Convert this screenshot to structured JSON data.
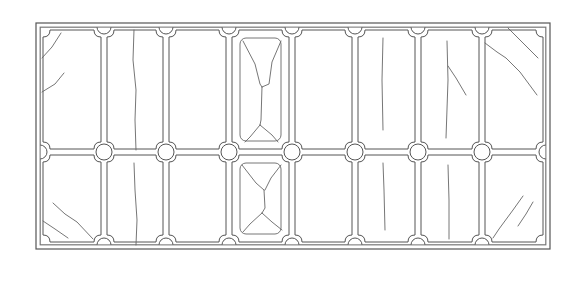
{
  "diagram": {
    "colors": {
      "line": "#555555",
      "background": "#ffffff"
    },
    "frame": {
      "outer": {
        "x": 36,
        "y": 23,
        "w": 514,
        "h": 226
      },
      "inner": {
        "x": 40,
        "y": 27,
        "w": 506,
        "h": 218
      }
    },
    "grid": {
      "rows": 2,
      "cols": 8,
      "col_edges": [
        40,
        104,
        166,
        229,
        292,
        355,
        418,
        482,
        546
      ],
      "row_edges": [
        27,
        152,
        245
      ],
      "joint_radius": 8,
      "notch": 7,
      "gap": 3
    },
    "insets": [
      {
        "row": 0,
        "col": 3
      },
      {
        "row": 1,
        "col": 3
      }
    ],
    "cracks": [
      {
        "pane": "r0c0",
        "points": [
          [
            42,
            58
          ],
          [
            52,
            47
          ],
          [
            61,
            33
          ]
        ]
      },
      {
        "pane": "r0c0",
        "points": [
          [
            42,
            92
          ],
          [
            55,
            84
          ],
          [
            64,
            73
          ]
        ]
      },
      {
        "pane": "r0c1",
        "points": [
          [
            134,
            30
          ],
          [
            133,
            60
          ],
          [
            136,
            90
          ],
          [
            135,
            120
          ],
          [
            136,
            150
          ]
        ]
      },
      {
        "pane": "r0c3",
        "points": [
          [
            243,
            41
          ],
          [
            255,
            64
          ],
          [
            260,
            84
          ],
          [
            262,
            87
          ]
        ]
      },
      {
        "pane": "r0c3",
        "points": [
          [
            281,
            41
          ],
          [
            272,
            62
          ],
          [
            269,
            84
          ],
          [
            262,
            87
          ]
        ]
      },
      {
        "pane": "r0c3",
        "points": [
          [
            262,
            87
          ],
          [
            261,
            120
          ],
          [
            260,
            125
          ]
        ]
      },
      {
        "pane": "r0c3",
        "points": [
          [
            260,
            125
          ],
          [
            250,
            137
          ],
          [
            245,
            142
          ]
        ]
      },
      {
        "pane": "r0c3",
        "points": [
          [
            260,
            125
          ],
          [
            272,
            135
          ],
          [
            278,
            142
          ]
        ]
      },
      {
        "pane": "r0c5",
        "points": [
          [
            383,
            38
          ],
          [
            382,
            80
          ],
          [
            383,
            130
          ]
        ]
      },
      {
        "pane": "r0c6",
        "points": [
          [
            447,
            41
          ],
          [
            448,
            80
          ],
          [
            446,
            138
          ]
        ]
      },
      {
        "pane": "r0c6",
        "points": [
          [
            448,
            66
          ],
          [
            456,
            78
          ],
          [
            466,
            95
          ]
        ]
      },
      {
        "pane": "r0c7",
        "points": [
          [
            508,
            28
          ],
          [
            520,
            40
          ],
          [
            538,
            58
          ]
        ]
      },
      {
        "pane": "r0c7",
        "points": [
          [
            485,
            43
          ],
          [
            497,
            52
          ],
          [
            506,
            58
          ],
          [
            520,
            72
          ],
          [
            537,
            95
          ]
        ]
      },
      {
        "pane": "r1c0",
        "points": [
          [
            53,
            203
          ],
          [
            65,
            214
          ],
          [
            77,
            222
          ],
          [
            93,
            239
          ]
        ]
      },
      {
        "pane": "r1c0",
        "points": [
          [
            43,
            221
          ],
          [
            55,
            229
          ],
          [
            68,
            238
          ]
        ]
      },
      {
        "pane": "r1c1",
        "points": [
          [
            134,
            163
          ],
          [
            135,
            190
          ],
          [
            137,
            220
          ],
          [
            136,
            245
          ]
        ]
      },
      {
        "pane": "r1c3",
        "points": [
          [
            242,
            165
          ],
          [
            256,
            183
          ],
          [
            264,
            190
          ]
        ]
      },
      {
        "pane": "r1c3",
        "points": [
          [
            281,
            165
          ],
          [
            271,
            178
          ],
          [
            265,
            190
          ]
        ]
      },
      {
        "pane": "r1c3",
        "points": [
          [
            264,
            190
          ],
          [
            265,
            208
          ],
          [
            262,
            213
          ]
        ]
      },
      {
        "pane": "r1c3",
        "points": [
          [
            262,
            213
          ],
          [
            250,
            224
          ],
          [
            243,
            232
          ]
        ]
      },
      {
        "pane": "r1c3",
        "points": [
          [
            262,
            213
          ],
          [
            272,
            222
          ],
          [
            282,
            230
          ]
        ]
      },
      {
        "pane": "r1c5",
        "points": [
          [
            383,
            163
          ],
          [
            384,
            190
          ],
          [
            385,
            230
          ]
        ]
      },
      {
        "pane": "r1c6",
        "points": [
          [
            448,
            165
          ],
          [
            449,
            200
          ],
          [
            449,
            239
          ]
        ]
      },
      {
        "pane": "r1c7",
        "points": [
          [
            523,
            196
          ],
          [
            513,
            210
          ],
          [
            499,
            229
          ],
          [
            493,
            238
          ]
        ]
      },
      {
        "pane": "r1c7",
        "points": [
          [
            533,
            202
          ],
          [
            526,
            214
          ],
          [
            518,
            226
          ]
        ]
      }
    ]
  }
}
